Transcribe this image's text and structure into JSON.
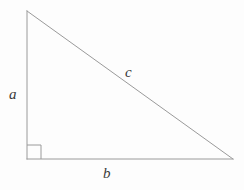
{
  "figure": {
    "kind": "right-triangle-diagram",
    "background_color": "#fdfdfd",
    "stroke_color": "#9a9a9a",
    "label_color": "#3a3a3a",
    "stroke_width": 1,
    "canvas": {
      "width": 244,
      "height": 190
    }
  },
  "geometry": {
    "vertices": {
      "apex": {
        "name": "top-vertex",
        "x": 27,
        "y": 11
      },
      "right_angle": {
        "name": "bottom-left-vertex",
        "x": 27,
        "y": 159
      },
      "base_end": {
        "name": "bottom-right-vertex",
        "x": 233,
        "y": 159
      }
    },
    "edges": [
      {
        "name": "vertical-leg",
        "label": "a",
        "from": "apex",
        "to": "right_angle"
      },
      {
        "name": "horizontal-leg",
        "label": "b",
        "from": "right_angle",
        "to": "base_end"
      },
      {
        "name": "hypotenuse",
        "label": "c",
        "from": "apex",
        "to": "base_end"
      }
    ],
    "right_angle_marker": {
      "x": 27,
      "y": 145,
      "size": 14
    }
  },
  "labels": {
    "leg_vertical": "a",
    "leg_horizontal": "b",
    "hypotenuse": "c"
  }
}
